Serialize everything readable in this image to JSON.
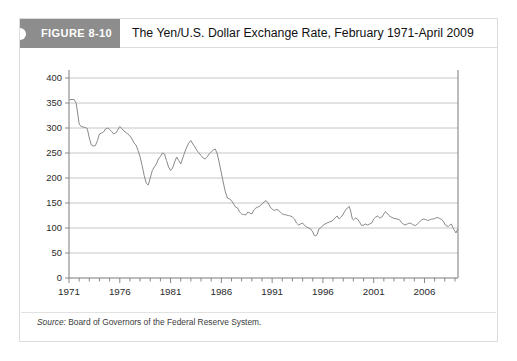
{
  "figure": {
    "badge_label": "FIGURE 8-10",
    "title": "The Yen/U.S. Dollar Exchange Rate, February 1971-April 2009",
    "source_label": "Source:",
    "source_text": " Board of Governors of the Federal Reserve System.",
    "badge_color": "#8d8d8d",
    "line_color": "#8a8a8a",
    "grid_color": "#b8b8b8",
    "axis_color": "#7a7a7a"
  },
  "chart_data": {
    "type": "line",
    "title": "The Yen/U.S. Dollar Exchange Rate, February 1971-April 2009",
    "xlabel": "",
    "ylabel": "",
    "grid": "horizontal",
    "legend": "none",
    "xlim": [
      1971,
      2009.3
    ],
    "ylim": [
      0,
      400
    ],
    "ytick_labels": [
      "0",
      "50",
      "100",
      "150",
      "200",
      "250",
      "300",
      "350",
      "400"
    ],
    "ytick_values": [
      0,
      50,
      100,
      150,
      200,
      250,
      300,
      350,
      400
    ],
    "xtick_labels": [
      "1971",
      "1976",
      "1981",
      "1986",
      "1991",
      "1996",
      "2001",
      "2006"
    ],
    "xtick_values": [
      1971,
      1976,
      1981,
      1986,
      1991,
      1996,
      2001,
      2006
    ],
    "xtick_minor_step": 1,
    "series": [
      {
        "name": "Yen per U.S. Dollar",
        "x": [
          1971.1,
          1971.3,
          1971.5,
          1971.7,
          1971.85,
          1972.0,
          1972.2,
          1972.4,
          1972.6,
          1972.8,
          1973.0,
          1973.2,
          1973.4,
          1973.6,
          1973.8,
          1974.0,
          1974.2,
          1974.4,
          1974.6,
          1974.8,
          1975.0,
          1975.2,
          1975.4,
          1975.6,
          1975.8,
          1976.0,
          1976.2,
          1976.4,
          1976.6,
          1976.8,
          1977.0,
          1977.2,
          1977.4,
          1977.6,
          1977.8,
          1978.0,
          1978.2,
          1978.4,
          1978.6,
          1978.8,
          1979.0,
          1979.2,
          1979.4,
          1979.6,
          1979.8,
          1980.0,
          1980.2,
          1980.4,
          1980.6,
          1980.8,
          1981.0,
          1981.2,
          1981.4,
          1981.6,
          1981.8,
          1982.0,
          1982.2,
          1982.4,
          1982.6,
          1982.8,
          1983.0,
          1983.2,
          1983.4,
          1983.6,
          1983.8,
          1984.0,
          1984.2,
          1984.4,
          1984.6,
          1984.8,
          1985.0,
          1985.2,
          1985.4,
          1985.6,
          1985.8,
          1986.0,
          1986.2,
          1986.4,
          1986.6,
          1986.8,
          1987.0,
          1987.2,
          1987.4,
          1987.6,
          1987.8,
          1988.0,
          1988.2,
          1988.4,
          1988.6,
          1988.8,
          1989.0,
          1989.2,
          1989.4,
          1989.6,
          1989.8,
          1990.0,
          1990.2,
          1990.4,
          1990.6,
          1990.8,
          1991.0,
          1991.2,
          1991.4,
          1991.6,
          1991.8,
          1992.0,
          1992.2,
          1992.4,
          1992.6,
          1992.8,
          1993.0,
          1993.2,
          1993.4,
          1993.6,
          1993.8,
          1994.0,
          1994.2,
          1994.4,
          1994.6,
          1994.8,
          1995.0,
          1995.15,
          1995.3,
          1995.45,
          1995.6,
          1995.8,
          1996.0,
          1996.2,
          1996.4,
          1996.6,
          1996.8,
          1997.0,
          1997.2,
          1997.4,
          1997.6,
          1997.8,
          1998.0,
          1998.2,
          1998.4,
          1998.6,
          1998.75,
          1998.9,
          1999.0,
          1999.2,
          1999.4,
          1999.6,
          1999.8,
          2000.0,
          2000.2,
          2000.4,
          2000.6,
          2000.8,
          2001.0,
          2001.2,
          2001.4,
          2001.6,
          2001.8,
          2002.0,
          2002.15,
          2002.3,
          2002.5,
          2002.7,
          2002.9,
          2003.1,
          2003.3,
          2003.5,
          2003.7,
          2003.9,
          2004.1,
          2004.3,
          2004.5,
          2004.7,
          2004.9,
          2005.1,
          2005.3,
          2005.5,
          2005.7,
          2005.9,
          2006.1,
          2006.3,
          2006.5,
          2006.7,
          2006.9,
          2007.1,
          2007.3,
          2007.5,
          2007.7,
          2007.9,
          2008.05,
          2008.2,
          2008.35,
          2008.5,
          2008.65,
          2008.8,
          2008.95,
          2009.1,
          2009.25
        ],
        "y": [
          357,
          357,
          357,
          350,
          330,
          308,
          303,
          302,
          301,
          299,
          280,
          266,
          264,
          265,
          275,
          288,
          290,
          292,
          298,
          300,
          297,
          293,
          288,
          290,
          296,
          303,
          299,
          294,
          291,
          288,
          284,
          278,
          270,
          266,
          255,
          242,
          225,
          205,
          190,
          186,
          200,
          215,
          222,
          228,
          238,
          243,
          250,
          248,
          235,
          222,
          215,
          220,
          232,
          242,
          235,
          228,
          240,
          252,
          262,
          270,
          275,
          268,
          262,
          255,
          250,
          245,
          240,
          238,
          242,
          248,
          252,
          256,
          258,
          248,
          230,
          210,
          190,
          172,
          160,
          158,
          155,
          148,
          142,
          140,
          132,
          128,
          127,
          126,
          132,
          130,
          128,
          136,
          140,
          142,
          144,
          148,
          152,
          155,
          150,
          142,
          138,
          135,
          137,
          136,
          132,
          128,
          127,
          126,
          125,
          124,
          122,
          118,
          110,
          106,
          108,
          110,
          105,
          102,
          100,
          98,
          92,
          85,
          84,
          88,
          98,
          101,
          105,
          108,
          110,
          112,
          113,
          116,
          120,
          124,
          118,
          122,
          128,
          135,
          140,
          143,
          132,
          118,
          116,
          120,
          118,
          112,
          105,
          106,
          108,
          106,
          108,
          110,
          118,
          122,
          124,
          120,
          122,
          128,
          133,
          130,
          125,
          122,
          120,
          119,
          118,
          117,
          112,
          108,
          106,
          108,
          110,
          109,
          106,
          105,
          108,
          112,
          116,
          118,
          117,
          115,
          116,
          118,
          118,
          120,
          121,
          119,
          117,
          112,
          106,
          104,
          103,
          106,
          108,
          101,
          95,
          90,
          97
        ]
      }
    ],
    "key_points": {
      "start_value": 357,
      "start_date": "February 1971",
      "end_value": 97,
      "end_date": "April 2009",
      "max_value": 357,
      "min_value": 84,
      "min_date": "April 1995"
    }
  }
}
